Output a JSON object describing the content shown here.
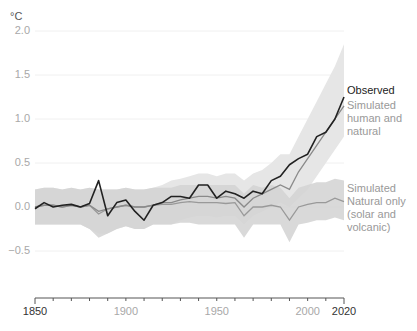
{
  "chart_data": {
    "type": "line",
    "title": "",
    "ylabel": "°C",
    "xlabel": "",
    "ylim": [
      -0.6,
      2.0
    ],
    "xlim": [
      1850,
      2020
    ],
    "yticks": [
      "2.0",
      "1.5",
      "1.0",
      "0.5",
      "0.0",
      "−0.5"
    ],
    "ytick_values": [
      2.0,
      1.5,
      1.0,
      0.5,
      0.0,
      -0.5
    ],
    "xticks": [
      "1850",
      "1900",
      "1950",
      "2000",
      "2020"
    ],
    "xtick_values": [
      1850,
      1900,
      1950,
      2000,
      2020
    ],
    "grid": true,
    "legend_position": "right, inline labels",
    "x": [
      1850,
      1855,
      1860,
      1865,
      1870,
      1875,
      1880,
      1885,
      1890,
      1895,
      1900,
      1905,
      1910,
      1915,
      1920,
      1925,
      1930,
      1935,
      1940,
      1945,
      1950,
      1955,
      1960,
      1965,
      1970,
      1975,
      1980,
      1985,
      1990,
      1995,
      2000,
      2005,
      2010,
      2015,
      2020
    ],
    "series": [
      {
        "name": "Observed",
        "color": "#222222",
        "values": [
          -0.02,
          0.05,
          0.0,
          0.02,
          0.03,
          0.0,
          0.04,
          0.3,
          -0.1,
          0.05,
          0.08,
          -0.05,
          -0.15,
          0.02,
          0.05,
          0.12,
          0.12,
          0.1,
          0.25,
          0.25,
          0.1,
          0.18,
          0.15,
          0.1,
          0.18,
          0.15,
          0.3,
          0.35,
          0.48,
          0.55,
          0.6,
          0.8,
          0.85,
          1.0,
          1.25
        ]
      },
      {
        "name": "Simulated human and natural",
        "color": "#8a8a8a",
        "values": [
          0.0,
          0.02,
          0.02,
          0.0,
          0.02,
          0.0,
          0.02,
          -0.05,
          -0.02,
          0.0,
          0.02,
          0.0,
          0.0,
          0.02,
          0.05,
          0.05,
          0.08,
          0.1,
          0.12,
          0.12,
          0.1,
          0.12,
          0.1,
          0.0,
          0.1,
          0.15,
          0.2,
          0.25,
          0.2,
          0.4,
          0.55,
          0.7,
          0.85,
          1.0,
          1.15
        ],
        "band": {
          "lower": [
            -0.2,
            -0.2,
            -0.2,
            -0.2,
            -0.2,
            -0.2,
            -0.25,
            -0.3,
            -0.3,
            -0.25,
            -0.22,
            -0.25,
            -0.25,
            -0.2,
            -0.2,
            -0.2,
            -0.15,
            -0.12,
            -0.1,
            -0.1,
            -0.12,
            -0.1,
            -0.1,
            -0.2,
            -0.1,
            -0.05,
            0.0,
            0.05,
            0.0,
            0.1,
            0.2,
            0.35,
            0.5,
            0.65,
            0.8
          ],
          "upper": [
            0.2,
            0.22,
            0.22,
            0.2,
            0.22,
            0.2,
            0.22,
            0.2,
            0.2,
            0.2,
            0.22,
            0.2,
            0.2,
            0.22,
            0.25,
            0.3,
            0.32,
            0.35,
            0.38,
            0.38,
            0.35,
            0.38,
            0.38,
            0.3,
            0.38,
            0.42,
            0.5,
            0.6,
            0.6,
            0.8,
            1.0,
            1.2,
            1.4,
            1.6,
            1.85
          ]
        }
      },
      {
        "name": "Simulated Natural only (solar and volcanic)",
        "color": "#999999",
        "values": [
          0.0,
          0.02,
          0.02,
          0.0,
          0.02,
          0.0,
          0.02,
          -0.08,
          -0.02,
          0.0,
          0.02,
          0.0,
          0.0,
          0.02,
          0.03,
          0.03,
          0.05,
          0.06,
          0.05,
          0.05,
          0.05,
          0.04,
          0.05,
          -0.1,
          0.0,
          0.0,
          0.02,
          0.0,
          -0.15,
          0.0,
          0.03,
          0.05,
          0.05,
          0.1,
          0.06
        ],
        "band": {
          "lower": [
            -0.2,
            -0.2,
            -0.2,
            -0.2,
            -0.2,
            -0.2,
            -0.25,
            -0.35,
            -0.3,
            -0.25,
            -0.22,
            -0.25,
            -0.25,
            -0.2,
            -0.2,
            -0.2,
            -0.18,
            -0.18,
            -0.2,
            -0.2,
            -0.2,
            -0.2,
            -0.2,
            -0.35,
            -0.2,
            -0.2,
            -0.2,
            -0.2,
            -0.4,
            -0.2,
            -0.18,
            -0.15,
            -0.15,
            -0.12,
            -0.15
          ],
          "upper": [
            0.2,
            0.22,
            0.22,
            0.2,
            0.22,
            0.2,
            0.22,
            0.2,
            0.2,
            0.2,
            0.22,
            0.2,
            0.2,
            0.22,
            0.22,
            0.22,
            0.25,
            0.25,
            0.25,
            0.25,
            0.25,
            0.25,
            0.25,
            0.15,
            0.25,
            0.22,
            0.25,
            0.22,
            0.1,
            0.22,
            0.25,
            0.28,
            0.28,
            0.32,
            0.3
          ]
        }
      }
    ]
  },
  "labels": {
    "unit": "°C",
    "legend_observed": "Observed",
    "legend_human_1": "Simulated",
    "legend_human_2": "human and",
    "legend_human_3": "natural",
    "legend_natural_1": "Simulated",
    "legend_natural_2": "Natural only",
    "legend_natural_3": "(solar and",
    "legend_natural_4": "volcanic)"
  },
  "colors": {
    "observed": "#222222",
    "human_line": "#8a8a8a",
    "human_band": "#e6e6e6",
    "natural_line": "#999999",
    "natural_band": "#d2d2d2",
    "grid": "#f0f0f0",
    "axis": "#555555"
  }
}
